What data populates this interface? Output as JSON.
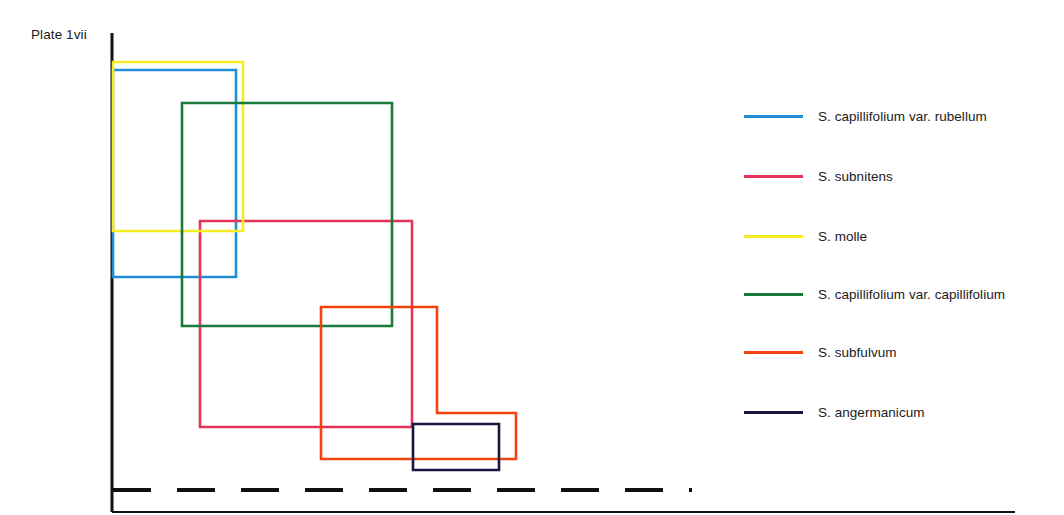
{
  "title": "Plate 1vii",
  "chart_data": {
    "type": "line",
    "title": "Plate 1vii",
    "xlabel": "",
    "ylabel": "",
    "grid": false,
    "legend_position": "right",
    "axis_color": "#111111",
    "series": [
      {
        "name": "S. capillifolium var. rubellum",
        "color": "#1f8ed6",
        "shape": "rectangle",
        "points": [
          [
            113,
            70
          ],
          [
            236,
            70
          ],
          [
            236,
            277
          ],
          [
            113,
            277
          ]
        ]
      },
      {
        "name": "S. subnitens",
        "color": "#e8325a",
        "shape": "rectangle",
        "points": [
          [
            200,
            221
          ],
          [
            412,
            221
          ],
          [
            412,
            427
          ],
          [
            200,
            427
          ]
        ]
      },
      {
        "name": "S. molle",
        "color": "#f7ec21",
        "shape": "rectangle",
        "points": [
          [
            113,
            62
          ],
          [
            243,
            62
          ],
          [
            243,
            231
          ],
          [
            113,
            231
          ]
        ]
      },
      {
        "name": "S. capillifolium var. capillifolium",
        "color": "#1a7a3e",
        "shape": "rectangle",
        "points": [
          [
            182,
            103
          ],
          [
            392,
            103
          ],
          [
            392,
            326
          ],
          [
            182,
            326
          ]
        ]
      },
      {
        "name": "S. subfulvum",
        "color": "#f2420d",
        "shape": "step-polygon",
        "points": [
          [
            321,
            307
          ],
          [
            437,
            307
          ],
          [
            437,
            413
          ],
          [
            516,
            413
          ],
          [
            516,
            459
          ],
          [
            321,
            459
          ]
        ]
      },
      {
        "name": "S. angermanicum",
        "color": "#1b1340",
        "shape": "rectangle",
        "points": [
          [
            413,
            424
          ],
          [
            499,
            424
          ],
          [
            499,
            470
          ],
          [
            413,
            470
          ]
        ]
      }
    ],
    "baseline": {
      "name": "dashed-baseline",
      "color": "#111111",
      "style": "dashed",
      "y": 490,
      "x_start": 113,
      "x_end": 692
    },
    "axes": {
      "y_axis": {
        "x": 112,
        "y_top": 33,
        "y_bottom": 512
      },
      "x_axis": {
        "y": 512,
        "x_start": 112,
        "x_end": 1015
      }
    }
  },
  "legend": {
    "items": [
      {
        "label": "S. capillifolium var. rubellum",
        "color": "#1f8ed6",
        "y": 116
      },
      {
        "label": "S. subnitens",
        "color": "#e8325a",
        "y": 176
      },
      {
        "label": "S. molle",
        "color": "#f7ec21",
        "y": 236
      },
      {
        "label": "S. capillifolium var. capillifolium",
        "color": "#1a7a3e",
        "y": 294
      },
      {
        "label": "S. subfulvum",
        "color": "#f2420d",
        "y": 352
      },
      {
        "label": "S. angermanicum",
        "color": "#1b1340",
        "y": 412
      }
    ]
  }
}
